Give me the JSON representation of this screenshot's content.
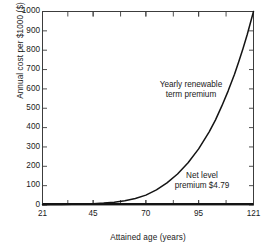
{
  "chart_data": {
    "type": "line",
    "title": "",
    "xlabel": "Attained age (years)",
    "ylabel": "Annual cost per $1000 ($)",
    "xlim": [
      21,
      121
    ],
    "ylim": [
      0,
      1000
    ],
    "grid": false,
    "legend_position": "inline-annotation",
    "xticks": [
      21,
      45,
      70,
      95,
      121
    ],
    "xtick_labels": [
      "21",
      "45",
      "70",
      "95",
      "121"
    ],
    "yticks": [
      0,
      100,
      200,
      300,
      400,
      500,
      600,
      700,
      800,
      900,
      1000
    ],
    "ytick_labels": [
      "0",
      "100",
      "200",
      "300",
      "400",
      "500",
      "600",
      "700",
      "800",
      "900",
      "1000"
    ],
    "x_minor_ticks": [
      33,
      45,
      58,
      70,
      83,
      95,
      108
    ],
    "annotations": [
      {
        "name": "yearly-renewable-term-premium",
        "lines": [
          "Yearly renewable",
          "term premium"
        ],
        "text": "Yearly renewable term premium"
      },
      {
        "name": "net-level-premium",
        "lines": [
          "Net level",
          "premium $4.79"
        ],
        "text": "Net level premium $4.79",
        "value": 4.79
      }
    ],
    "series": [
      {
        "name": "Yearly renewable term premium",
        "color": "#141414",
        "x": [
          21,
          25,
          30,
          35,
          40,
          45,
          50,
          55,
          60,
          65,
          70,
          75,
          80,
          85,
          90,
          95,
          100,
          103,
          106,
          109,
          112,
          114,
          116,
          118,
          119,
          120,
          121
        ],
        "values": [
          1.9,
          2.2,
          2.8,
          3.6,
          4.9,
          6.8,
          9.8,
          14.5,
          21.8,
          33.2,
          51,
          78,
          114,
          160,
          218,
          290,
          378,
          440,
          512,
          590,
          676,
          740,
          808,
          880,
          920,
          960,
          1000
        ]
      },
      {
        "name": "Net level premium $4.79",
        "color": "#141414",
        "x": [
          21,
          121
        ],
        "values": [
          4.79,
          4.79
        ]
      }
    ]
  },
  "figure": {
    "background": "#ffffff",
    "axis_color": "#3c3c3c",
    "line_color": "#141414"
  }
}
